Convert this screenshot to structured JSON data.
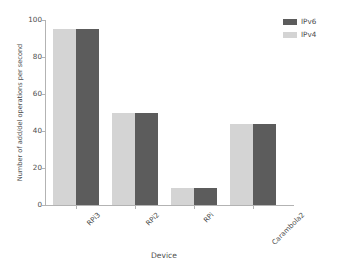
{
  "chart_data": {
    "type": "bar",
    "title": "",
    "xlabel": "Device",
    "ylabel": "Number of add/del operations per second",
    "categories": [
      "RPi3",
      "RPi2",
      "RPi",
      "Carambola2"
    ],
    "series": [
      {
        "name": "IPv4",
        "color": "#d4d4d4",
        "values": [
          95,
          50,
          9,
          44
        ]
      },
      {
        "name": "IPv6",
        "color": "#5c5c5c",
        "values": [
          95,
          50,
          9,
          44
        ]
      }
    ],
    "ylim": [
      0,
      100
    ],
    "yticks": [
      100,
      80,
      60,
      40,
      20,
      0
    ],
    "ytick_labels": [
      "100",
      "80",
      "60",
      "40",
      "20",
      "0"
    ],
    "grid": false,
    "legend_position": "top-right",
    "legend_order": [
      "IPv6",
      "IPv4"
    ],
    "xtick_rotation": -45
  },
  "legend": {
    "entries": [
      {
        "label": "IPv6",
        "color": "#5c5c5c"
      },
      {
        "label": "IPv4",
        "color": "#d4d4d4"
      }
    ]
  },
  "axes": {
    "x_title": "Device",
    "y_title": "Number of add/del operations per second"
  },
  "colors": {
    "ipv4": "#d4d4d4",
    "ipv6": "#5c5c5c",
    "axis": "#b3b3b3",
    "text": "#4d4d4d",
    "background": "#ffffff"
  }
}
